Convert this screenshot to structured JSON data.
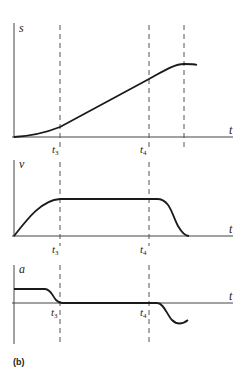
{
  "figure": {
    "caption": "(b)",
    "panels": [
      {
        "id": "s",
        "y_label": "s",
        "x_label": "t",
        "ticks": [
          {
            "main": "t",
            "sub": "3"
          },
          {
            "main": "t",
            "sub": "4"
          }
        ]
      },
      {
        "id": "v",
        "y_label": "v",
        "x_label": "t",
        "ticks": [
          {
            "main": "t",
            "sub": "3"
          },
          {
            "main": "t",
            "sub": "4"
          }
        ]
      },
      {
        "id": "a",
        "y_label": "a",
        "x_label": "t",
        "ticks": [
          {
            "main": "t",
            "sub": "3"
          },
          {
            "main": "t",
            "sub": "4"
          }
        ]
      }
    ]
  },
  "colors": {
    "curve": "#1a1a1a",
    "axis": "#444444",
    "dash": "#555555",
    "text": "#222222"
  }
}
